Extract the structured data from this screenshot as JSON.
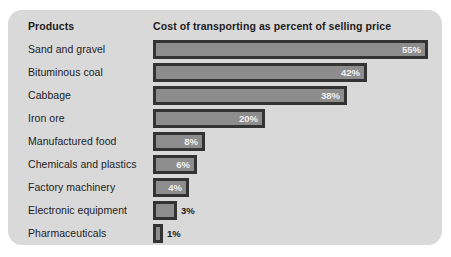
{
  "panel": {
    "background_color": "#d9d9d9",
    "bar_fill_color": "#8d8d8d",
    "bar_border_color": "#333333"
  },
  "headers": {
    "products": "Products",
    "measure": "Cost of transporting as percent of selling price"
  },
  "chart_data": {
    "type": "bar",
    "orientation": "horizontal",
    "title": "Cost of transporting as percent of selling price",
    "xlabel": "",
    "ylabel": "Products",
    "xlim": [
      0,
      55
    ],
    "grid": false,
    "legend": null,
    "categories": [
      "Sand and gravel",
      "Bituminous coal",
      "Cabbage",
      "Iron ore",
      "Manufactured food",
      "Chemicals and plastics",
      "Factory machinery",
      "Electronic equipment",
      "Pharmaceuticals"
    ],
    "values": [
      55,
      42,
      38,
      20,
      8,
      6,
      4,
      3,
      1
    ],
    "value_labels": [
      "55%",
      "42%",
      "38%",
      "20%",
      "8%",
      "6%",
      "4%",
      "3%",
      "1%"
    ],
    "label_placement": [
      "inside",
      "inside",
      "inside",
      "inside",
      "inside",
      "inside",
      "inside",
      "outside",
      "outside"
    ],
    "bar_pixel_widths": [
      275,
      214,
      194,
      112,
      52,
      44,
      36,
      24,
      10
    ]
  }
}
